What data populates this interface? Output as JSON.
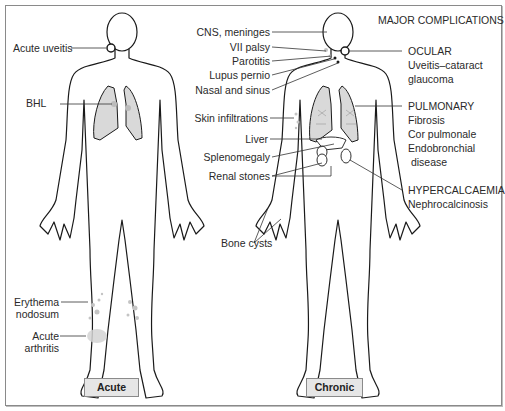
{
  "title": "MAJOR COMPLICATIONS",
  "panels": {
    "acute": {
      "caption": "Acute",
      "labels": {
        "uveitis": "Acute uveitis",
        "bhl": "BHL",
        "erythema_1": "Erythema",
        "erythema_2": "nodosum",
        "arthritis_1": "Acute",
        "arthritis_2": "arthritis"
      }
    },
    "chronic": {
      "caption": "Chronic",
      "left_labels": {
        "cns": "CNS, meninges",
        "vii": "VII palsy",
        "parotitis": "Parotitis",
        "lupus": "Lupus pernio",
        "nasal": "Nasal and sinus",
        "skin": "Skin infiltrations",
        "liver": "Liver",
        "spleen": "Splenomegaly",
        "renal": "Renal stones",
        "bone": "Bone cysts"
      },
      "right_labels": {
        "ocular": {
          "heading": "OCULAR",
          "lines": [
            "Uveitis–cataract",
            "glaucoma"
          ]
        },
        "pulmonary": {
          "heading": "PULMONARY",
          "lines": [
            "Fibrosis",
            "Cor pulmonale",
            "Endobronchial",
            " disease"
          ]
        },
        "hypercalcaemia": {
          "heading": "HYPERCALCAEMIA",
          "lines": [
            "Nephrocalcinosis"
          ]
        }
      }
    }
  },
  "colors": {
    "outline": "#1a1a1a",
    "lung_fill": "#d9d9d9",
    "lesion": "#c4c4c4",
    "caption_bg": "#e6e6e6",
    "leader": "#333333"
  }
}
